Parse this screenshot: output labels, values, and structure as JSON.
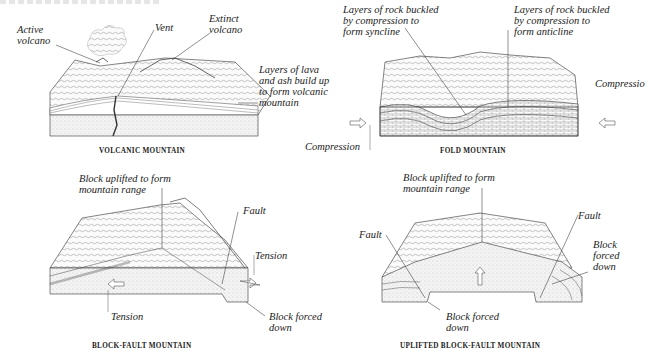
{
  "figure": {
    "panels": [
      {
        "id": "volcanic",
        "caption": "VOLCANIC MOUNTAIN",
        "labels": {
          "active_volcano": "Active\nvolcano",
          "vent": "Vent",
          "extinct_volcano": "Extinct\nvolcano",
          "layers": "Layers of lava\nand ash build up\nto form volcanic\nmountain"
        }
      },
      {
        "id": "fold",
        "caption": "FOLD MOUNTAIN",
        "labels": {
          "syncline": "Layers of rock buckled\nby compression to\nform syncline",
          "anticline": "Layers of rock buckled\nby compression to\nform anticline",
          "compression_left": "Compression",
          "compression_right": "Compressio"
        }
      },
      {
        "id": "block_fault",
        "caption": "BLOCK-FAULT MOUNTAIN",
        "labels": {
          "uplifted": "Block uplifted to form\nmountain range",
          "fault": "Fault",
          "tension_right": "Tension",
          "tension_left": "Tension",
          "forced_down": "Block forced\ndown"
        }
      },
      {
        "id": "uplifted_block_fault",
        "caption": "UPLIFTED BLOCK-FAULT MOUNTAIN",
        "labels": {
          "uplifted": "Block uplifted to form\nmountain range",
          "fault_left": "Fault",
          "fault_right": "Fault",
          "forced_down_right": "Block\nforced\ndown",
          "forced_down_bottom": "Block forced\ndown"
        }
      }
    ]
  }
}
